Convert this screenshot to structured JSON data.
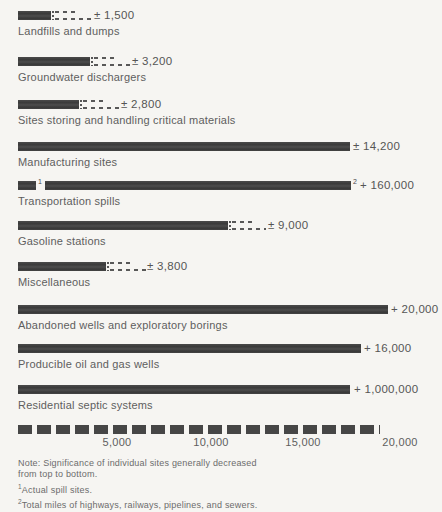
{
  "figure": {
    "background_color": "#f6f5f2",
    "bar_color": "#404040",
    "label_color": "#5e5e5e"
  },
  "chart_data": {
    "type": "bar",
    "orientation": "horizontal",
    "title": "",
    "xlabel": "",
    "ylabel": "",
    "axis": {
      "ticks": [
        "5,000",
        "10,000",
        "15,000",
        "20,000"
      ],
      "range": [
        0,
        20000
      ],
      "grid": false
    },
    "rows": [
      {
        "label": "Landfills and dumps",
        "value_text": "± 1,500",
        "value": 1500,
        "px": {
          "bar": 33,
          "dash_top": 20,
          "dash_bottom": 36,
          "value_x": 94
        }
      },
      {
        "label": "Groundwater dischargers",
        "value_text": "± 3,200",
        "value": 3200,
        "px": {
          "bar": 72,
          "dash_top": 22,
          "dash_bottom": 38,
          "value_x": 132
        }
      },
      {
        "label": "Sites storing and handling critical materials",
        "value_text": "± 2,800",
        "value": 2800,
        "px": {
          "bar": 61,
          "dash_top": 20,
          "dash_bottom": 36,
          "value_x": 121
        }
      },
      {
        "label": "Manufacturing sites",
        "value_text": "± 14,200",
        "value": 14200,
        "px": {
          "bar": 332,
          "value_x": 353
        }
      },
      {
        "label": "Transportation spills",
        "value_text": "+ 160,000",
        "value": 160000,
        "sup1": "1",
        "sup2": "2",
        "px": {
          "bar": 18,
          "bar2_x": 45,
          "bar2_w": 306,
          "value_x": 360
        }
      },
      {
        "label": "Gasoline stations",
        "value_text": "± 9,000",
        "value": 9000,
        "px": {
          "bar": 210,
          "dash_top": 20,
          "dash_bottom": 34,
          "value_x": 268
        }
      },
      {
        "label": "Miscellaneous",
        "value_text": "± 3,800",
        "value": 3800,
        "px": {
          "bar": 88,
          "dash_top": 20,
          "dash_bottom": 36,
          "value_x": 147
        }
      },
      {
        "label": "Abandoned wells and exploratory borings",
        "value_text": "+ 20,000",
        "value": 20000,
        "px": {
          "bar": 370,
          "value_x": 391
        }
      },
      {
        "label": "Producible oil and gas wells",
        "value_text": "+ 16,000",
        "value": 16000,
        "px": {
          "bar": 343,
          "value_x": 364
        }
      },
      {
        "label": "Residential septic systems",
        "value_text": "+ 1,000,000",
        "value": 1000000,
        "px": {
          "bar": 332,
          "value_x": 354
        }
      }
    ],
    "notes": {
      "line1": "Note: Significance of individual sites generally decreased",
      "line2": "from top to bottom.",
      "fn1_sup": "1",
      "fn1_text": "Actual spill sites.",
      "fn2_sup": "2",
      "fn2_text": "Total miles of highways, railways, pipelines, and sewers."
    }
  },
  "layout_px": {
    "row_tops": [
      11,
      57,
      100,
      142,
      181,
      221,
      262,
      305,
      344,
      385
    ],
    "bar_left": 18,
    "bar_height": 9,
    "tick_centers": [
      117,
      211,
      303,
      400
    ]
  }
}
